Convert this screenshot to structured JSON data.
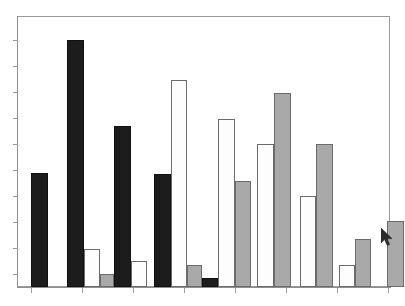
{
  "chart_data": {
    "type": "bar",
    "title": "",
    "subtitle": "",
    "xlabel": "",
    "ylabel": "",
    "categories": [
      "1",
      "2",
      "3",
      "4",
      "5"
    ],
    "series": [
      {
        "name": "Series 1 (black)",
        "color": "#1c1c1c",
        "values": [
          42,
          92,
          64,
          41,
          0
        ]
      },
      {
        "name": "Series 2 (white)",
        "color": "#fdfdfd",
        "values": [
          0,
          13,
          8,
          77,
          58
        ]
      },
      {
        "name": "Series 3 (gray)",
        "color": "#a9a9a9",
        "values": [
          0,
          4,
          0,
          6,
          30
        ]
      }
    ],
    "ylim": [
      0,
      100
    ],
    "xlim": [
      0,
      5
    ],
    "grid": false,
    "legend": "none",
    "axis_tick_labels": false,
    "y_ticks": [
      0,
      10,
      20,
      30,
      40,
      50,
      60,
      70,
      80,
      90,
      100
    ],
    "x_ticks": [
      0,
      1,
      2,
      3,
      4,
      5
    ],
    "bars": [
      {
        "label": "g1-black",
        "series": "black",
        "value": 42,
        "x_px": 14,
        "width_px": 16,
        "top_px": 157,
        "height_px": 114
      },
      {
        "label": "g2-black",
        "series": "black",
        "value": 92,
        "x_px": 50,
        "width_px": 16,
        "top_px": 24,
        "height_px": 247
      },
      {
        "label": "g2-white",
        "series": "white",
        "value": 13,
        "x_px": 66,
        "width_px": 15,
        "top_px": 233,
        "height_px": 38
      },
      {
        "label": "g2-gray",
        "series": "gray",
        "value": 4,
        "x_px": 81,
        "width_px": 13,
        "top_px": 256,
        "height_px": 15
      },
      {
        "label": "g3-black",
        "series": "black",
        "value": 64,
        "x_px": 95,
        "width_px": 17,
        "top_px": 110,
        "height_px": 161
      },
      {
        "label": "g3-white",
        "series": "white",
        "value": 8,
        "x_px": 112,
        "width_px": 16,
        "top_px": 245,
        "height_px": 26
      },
      {
        "label": "g4-black",
        "series": "black",
        "value": 41,
        "x_px": 108,
        "width_px": 0,
        "top_px": 0,
        "height_px": 0
      },
      {
        "label": "g4a-black",
        "series": "black",
        "value": 41,
        "x_px": 110,
        "width_px": 0,
        "top_px": 0,
        "height_px": 0
      }
    ]
  },
  "bars_render": [
    {
      "name": "bar-1-black",
      "type": "black",
      "left": 14,
      "width": 17,
      "top": 157,
      "height": 114
    },
    {
      "name": "bar-2-black",
      "type": "black",
      "left": 50,
      "width": 17,
      "top": 24,
      "height": 247
    },
    {
      "name": "bar-3-white",
      "type": "white",
      "left": 67,
      "width": 16,
      "top": 233,
      "height": 38
    },
    {
      "name": "bar-4-gray",
      "type": "gray",
      "left": 83,
      "width": 14,
      "top": 258,
      "height": 13
    },
    {
      "name": "bar-5-black",
      "type": "black",
      "left": 97,
      "width": 17,
      "top": 110,
      "height": 161
    },
    {
      "name": "bar-6-white",
      "type": "white",
      "left": 114,
      "width": 16,
      "top": 245,
      "height": 26
    },
    {
      "name": "bar-7-black",
      "type": "black",
      "left": 137,
      "width": 17,
      "top": 158,
      "height": 113
    },
    {
      "name": "bar-8-white",
      "type": "white",
      "left": 154,
      "width": 16,
      "top": 64,
      "height": 207
    },
    {
      "name": "bar-9-gray",
      "type": "gray",
      "left": 170,
      "width": 15,
      "top": 249,
      "height": 22
    },
    {
      "name": "bar-10-black",
      "type": "black",
      "left": 185,
      "width": 16,
      "top": 262,
      "height": 9
    },
    {
      "name": "bar-11-white",
      "type": "white",
      "left": 201,
      "width": 17,
      "top": 103,
      "height": 168
    },
    {
      "name": "bar-12-gray",
      "type": "gray",
      "left": 218,
      "width": 16,
      "top": 165,
      "height": 106
    },
    {
      "name": "bar-13-white",
      "type": "white",
      "left": 240,
      "width": 17,
      "top": 128,
      "height": 143
    },
    {
      "name": "bar-14-gray",
      "type": "gray",
      "left": 257,
      "width": 17,
      "top": 77,
      "height": 194
    },
    {
      "name": "bar-15-white",
      "type": "white",
      "left": 283,
      "width": 16,
      "top": 180,
      "height": 91
    },
    {
      "name": "bar-16-gray",
      "type": "gray",
      "left": 299,
      "width": 17,
      "top": 128,
      "height": 143
    },
    {
      "name": "bar-17-white",
      "type": "white",
      "left": 322,
      "width": 16,
      "top": 249,
      "height": 22
    },
    {
      "name": "bar-18-gray",
      "type": "gray",
      "left": 338,
      "width": 16,
      "top": 223,
      "height": 48
    },
    {
      "name": "bar-19-gray",
      "type": "gray",
      "left": 370,
      "width": 17,
      "top": 205,
      "height": 66
    }
  ],
  "axes": {
    "y_tick_positions_px": [
      24,
      50,
      76,
      102,
      128,
      154,
      180,
      206,
      232,
      258
    ],
    "x_tick_positions_px": [
      31,
      82,
      133,
      184,
      235,
      286,
      337,
      388
    ],
    "frame_color": "#9a9a9a",
    "axis_color": "#8e8e8e"
  },
  "cursor": {
    "name": "mouse-pointer",
    "x": 381,
    "y": 228,
    "color": "#2b2b2b"
  },
  "colors": {
    "background": "#ffffff",
    "series_black": "#1c1c1c",
    "series_white": "#fdfdfd",
    "series_gray": "#a9a9a9",
    "border": "#5a5a5a"
  }
}
